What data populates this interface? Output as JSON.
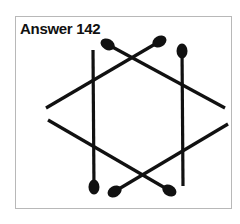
{
  "title": "Answer 142",
  "colors": {
    "stick": "#111111",
    "border": "#b8b8b8",
    "background": "#ffffff"
  },
  "matchsticks": [
    {
      "id": "stick-1",
      "x1": 105,
      "y1": 43,
      "x2": 225,
      "y2": 108,
      "head": "start"
    },
    {
      "id": "stick-2",
      "x1": 162,
      "y1": 40,
      "x2": 46,
      "y2": 108,
      "head": "start"
    },
    {
      "id": "stick-3",
      "x1": 94,
      "y1": 190,
      "x2": 93,
      "y2": 50,
      "head": "start"
    },
    {
      "id": "stick-4",
      "x1": 182,
      "y1": 48,
      "x2": 183,
      "y2": 186,
      "head": "start"
    },
    {
      "id": "stick-5",
      "x1": 172,
      "y1": 192,
      "x2": 48,
      "y2": 120,
      "head": "start"
    },
    {
      "id": "stick-6",
      "x1": 112,
      "y1": 193,
      "x2": 228,
      "y2": 124,
      "head": "start"
    }
  ]
}
